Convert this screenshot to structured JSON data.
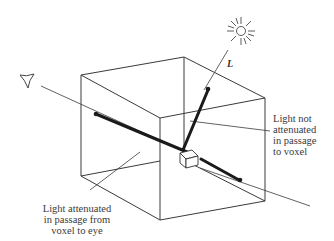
{
  "diagram": {
    "light_vector_label": "L",
    "label_light_not_attenuated": {
      "lines": [
        "Light not",
        "attenuated",
        "in passage",
        "to voxel"
      ]
    },
    "label_light_attenuated": {
      "lines": [
        "Light attenuated",
        "in passage from",
        "voxel to eye"
      ]
    },
    "icons": {
      "light_source": "sun-icon",
      "viewer": "eye-icon"
    },
    "colors": {
      "line": "#333333",
      "thick_ray": "#1a1a1a",
      "background": "#ffffff"
    }
  }
}
